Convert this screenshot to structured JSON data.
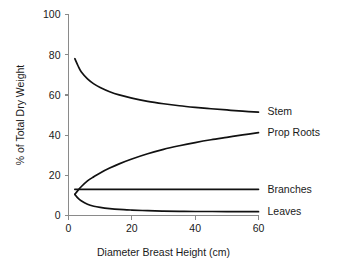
{
  "chart_data": {
    "type": "line",
    "title": "",
    "subtitle": "",
    "xlabel": "Diameter Breast Height (cm)",
    "ylabel": "% of Total Dry Weight",
    "xlim": [
      0,
      62
    ],
    "ylim": [
      0,
      100
    ],
    "xticks": [
      0,
      20,
      40,
      60
    ],
    "xtick_labels": [
      "0",
      "20",
      "40",
      "60"
    ],
    "yticks": [
      0,
      20,
      40,
      60,
      80,
      100
    ],
    "ytick_labels": [
      "0",
      "20",
      "40",
      "60",
      "80",
      "100"
    ],
    "grid": false,
    "legend_position": "right-inline",
    "line_color": "#111111",
    "axis_color": "#8a8a8a",
    "series": [
      {
        "name": "Stem",
        "label": "Stem",
        "x": [
          2,
          3,
          4,
          6,
          8,
          10,
          13,
          16,
          20,
          25,
          30,
          35,
          40,
          45,
          50,
          55,
          60
        ],
        "values": [
          78,
          74.5,
          71.5,
          68,
          65.5,
          63.7,
          61.6,
          60,
          58.4,
          56.8,
          55.6,
          54.6,
          53.8,
          53.1,
          52.5,
          51.9,
          51.4
        ]
      },
      {
        "name": "Prop Roots",
        "label": "Prop Roots",
        "x": [
          2,
          3,
          4,
          6,
          8,
          10,
          13,
          16,
          20,
          25,
          30,
          35,
          40,
          45,
          50,
          55,
          60
        ],
        "values": [
          10.5,
          12.5,
          14.3,
          17.2,
          19.3,
          21.2,
          23.6,
          25.7,
          28.1,
          30.7,
          32.9,
          34.7,
          36.3,
          37.7,
          38.9,
          40.1,
          41.2
        ]
      },
      {
        "name": "Branches",
        "label": "Branches",
        "x": [
          2,
          10,
          20,
          30,
          40,
          50,
          60
        ],
        "values": [
          13,
          13,
          13,
          13,
          13,
          13,
          13
        ]
      },
      {
        "name": "Leaves",
        "label": "Leaves",
        "x": [
          2,
          3,
          4,
          6,
          8,
          10,
          13,
          16,
          20,
          25,
          30,
          35,
          40,
          45,
          50,
          55,
          60
        ],
        "values": [
          10.5,
          8.6,
          7.3,
          5.6,
          4.6,
          4.0,
          3.4,
          3.0,
          2.7,
          2.4,
          2.2,
          2.1,
          2.0,
          2.0,
          1.9,
          1.9,
          1.9
        ]
      }
    ],
    "series_label_anchors": [
      {
        "name": "Stem",
        "x": 60,
        "y": 51.4
      },
      {
        "name": "Prop Roots",
        "x": 60,
        "y": 41.2
      },
      {
        "name": "Branches",
        "x": 60,
        "y": 13
      },
      {
        "name": "Leaves",
        "x": 60,
        "y": 1.9
      }
    ]
  }
}
